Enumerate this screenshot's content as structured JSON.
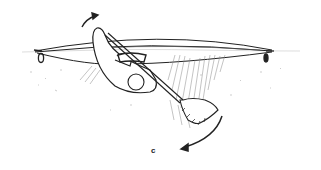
{
  "figure": {
    "label": "c",
    "stroke_color": "#222222",
    "hatch_color": "#777777",
    "background": "#ffffff"
  },
  "elements": {
    "kayak_hull": "kayak hull (inverted, seen from side)",
    "water_line": "water surface line",
    "paddler_body": "paddler torso rotated under hull",
    "paddler_head": "paddler head",
    "paddle": "paddle shaft with blade",
    "arrow_top": "rotation arrow (upper, hip flick direction)",
    "arrow_bottom": "sweep arrow (blade direction)",
    "bow_toggle": "bow grab loop",
    "stern_toggle": "stern grab loop"
  }
}
